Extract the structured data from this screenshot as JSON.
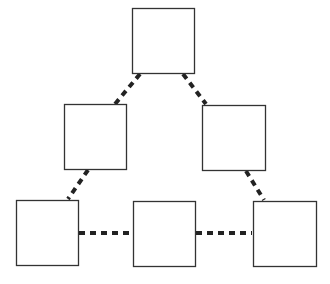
{
  "diagram": {
    "type": "pyramid-network",
    "colors": {
      "box_stroke": "#333333",
      "box_fill": "#ffffff",
      "link": "#222222",
      "background": "#ffffff"
    },
    "nodes": [
      {
        "id": "top",
        "x": 132,
        "y": 8,
        "w": 62,
        "h": 65,
        "label": ""
      },
      {
        "id": "mid-left",
        "x": 64,
        "y": 104,
        "w": 62,
        "h": 65,
        "label": ""
      },
      {
        "id": "mid-right",
        "x": 202,
        "y": 105,
        "w": 63,
        "h": 65,
        "label": ""
      },
      {
        "id": "bottom-left",
        "x": 16,
        "y": 200,
        "w": 62,
        "h": 65,
        "label": ""
      },
      {
        "id": "bottom-middle",
        "x": 133,
        "y": 201,
        "w": 62,
        "h": 65,
        "label": ""
      },
      {
        "id": "bottom-right",
        "x": 253,
        "y": 201,
        "w": 63,
        "h": 65,
        "label": ""
      }
    ],
    "edges": [
      {
        "from": "top",
        "to": "mid-left",
        "style": "dotted",
        "x1": 140,
        "y1": 74,
        "x2": 115,
        "y2": 104
      },
      {
        "from": "top",
        "to": "mid-right",
        "style": "dotted",
        "x1": 183,
        "y1": 74,
        "x2": 206,
        "y2": 104
      },
      {
        "from": "mid-left",
        "to": "bottom-left",
        "style": "dotted",
        "x1": 88,
        "y1": 170,
        "x2": 68,
        "y2": 199
      },
      {
        "from": "mid-right",
        "to": "bottom-right",
        "style": "dotted",
        "x1": 246,
        "y1": 171,
        "x2": 264,
        "y2": 200
      },
      {
        "from": "bottom-left",
        "to": "bottom-middle",
        "style": "dotted",
        "x1": 79,
        "y1": 233,
        "x2": 132,
        "y2": 233
      },
      {
        "from": "bottom-middle",
        "to": "bottom-right",
        "style": "dotted",
        "x1": 196,
        "y1": 233,
        "x2": 252,
        "y2": 233
      }
    ]
  }
}
